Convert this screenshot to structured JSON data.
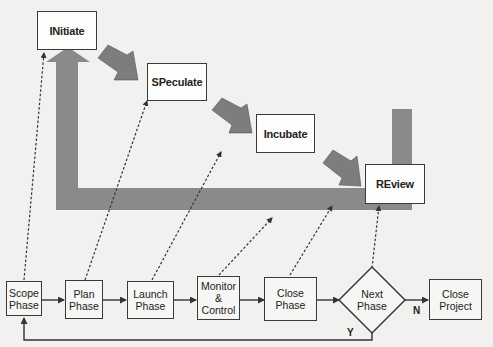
{
  "diagram": {
    "apf_stages": [
      {
        "id": "initiate",
        "label": "INitiate"
      },
      {
        "id": "speculate",
        "label": "SPeculate"
      },
      {
        "id": "incubate",
        "label": "Incubate"
      },
      {
        "id": "review",
        "label": "REview"
      }
    ],
    "lifecycle_phases": [
      {
        "id": "scope",
        "label": "Scope\nPhase"
      },
      {
        "id": "plan",
        "label": "Plan\nPhase"
      },
      {
        "id": "launch",
        "label": "Launch\nPhase"
      },
      {
        "id": "monitor",
        "label": "Monitor\n& Control"
      },
      {
        "id": "close-phase",
        "label": "Close\nPhase"
      }
    ],
    "decision": {
      "label": "Next\nPhase"
    },
    "end": {
      "label": "Close\nProject"
    },
    "edge_labels": {
      "no": "N",
      "yes": "Y"
    },
    "colors": {
      "background": "#f1f1ef",
      "arrow_fill": "#8a8a8a",
      "stroke": "#3a3a3a"
    }
  }
}
